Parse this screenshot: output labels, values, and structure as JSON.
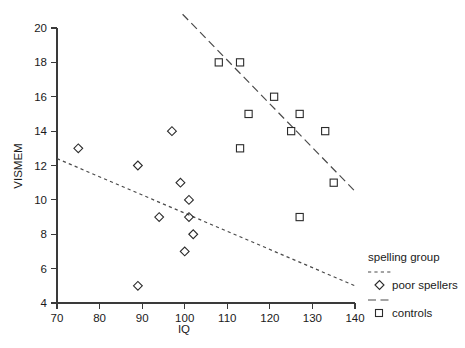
{
  "chart_data": {
    "type": "scatter",
    "title": "",
    "xlabel": "IQ",
    "ylabel": "VISMEM",
    "xlim": [
      70,
      140
    ],
    "ylim": [
      4,
      20
    ],
    "xticks": [
      70,
      80,
      90,
      100,
      110,
      120,
      130,
      140
    ],
    "yticks": [
      4,
      6,
      8,
      10,
      12,
      14,
      16,
      18,
      20
    ],
    "grid": false,
    "legend_position": "right",
    "legend_title": "spelling group",
    "series": [
      {
        "name": "poor spellers",
        "marker": "diamond",
        "line_style": "dotted",
        "color": "#2b2b2b",
        "points": [
          {
            "x": 75,
            "y": 13
          },
          {
            "x": 89,
            "y": 12
          },
          {
            "x": 94,
            "y": 9
          },
          {
            "x": 97,
            "y": 14
          },
          {
            "x": 99,
            "y": 11
          },
          {
            "x": 101,
            "y": 10
          },
          {
            "x": 101,
            "y": 9
          },
          {
            "x": 102,
            "y": 8
          },
          {
            "x": 100,
            "y": 7
          },
          {
            "x": 89,
            "y": 5
          }
        ],
        "fit_line": {
          "x1": 70,
          "y1": 12.4,
          "x2": 140,
          "y2": 5.0
        }
      },
      {
        "name": "controls",
        "marker": "square",
        "line_style": "dashed",
        "color": "#2b2b2b",
        "points": [
          {
            "x": 108,
            "y": 18
          },
          {
            "x": 113,
            "y": 18
          },
          {
            "x": 113,
            "y": 13
          },
          {
            "x": 115,
            "y": 15
          },
          {
            "x": 121,
            "y": 16
          },
          {
            "x": 125,
            "y": 14
          },
          {
            "x": 127,
            "y": 15
          },
          {
            "x": 127,
            "y": 9
          },
          {
            "x": 133,
            "y": 14
          },
          {
            "x": 135,
            "y": 11
          }
        ],
        "fit_line": {
          "x1": 99.5,
          "y1": 20.8,
          "x2": 140,
          "y2": 10.5
        }
      }
    ]
  },
  "axes": {
    "x_title": "IQ",
    "y_title": "VISMEM",
    "x_tick_labels": [
      "70",
      "80",
      "90",
      "100",
      "110",
      "120",
      "130",
      "140"
    ],
    "y_tick_labels": [
      "4",
      "6",
      "8",
      "10",
      "12",
      "14",
      "16",
      "18",
      "20"
    ]
  },
  "legend": {
    "title": "spelling group",
    "entries": [
      {
        "label": "poor spellers",
        "marker_icon": "diamond-marker-icon",
        "line_icon": "dotted-line-icon"
      },
      {
        "label": "controls",
        "marker_icon": "square-marker-icon",
        "line_icon": "dashed-line-icon"
      }
    ]
  },
  "colors": {
    "ink": "#1a1a1a",
    "axis": "#3a3a3a",
    "marker": "#2b2b2b",
    "fit_line": "#4a4a4a",
    "background": "#ffffff"
  }
}
